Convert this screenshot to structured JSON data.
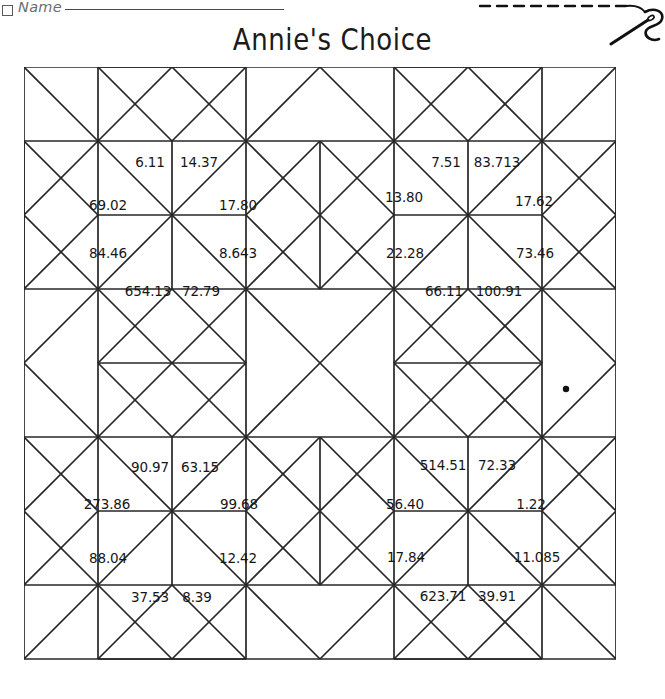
{
  "header": {
    "name_label": "Name",
    "name_checkbox_icon": "checkbox-icon",
    "title": "Annie's Choice",
    "decoration_icon": "needle-and-thread-icon"
  },
  "quilt": {
    "pattern_name": "Annie's Choice",
    "grid_columns": 8,
    "grid_rows": 8,
    "cell_size_px": 74,
    "line_color": "#262626",
    "fill_color": "#ffffff",
    "dot_marker": {
      "name": "ink-dot-mark",
      "x_px": 566,
      "y_px": 389
    },
    "blocks": [
      {
        "id": "block-top-left",
        "row": 0,
        "col": 0,
        "numbers": [
          {
            "slot": "top-left",
            "value": "6.11",
            "x": 150,
            "y": 163
          },
          {
            "slot": "top-right",
            "value": "14.37",
            "x": 199,
            "y": 163
          },
          {
            "slot": "left-upper",
            "value": "69.02",
            "x": 108,
            "y": 206
          },
          {
            "slot": "right-upper",
            "value": "17.80",
            "x": 238,
            "y": 206
          },
          {
            "slot": "left-lower",
            "value": "84.46",
            "x": 108,
            "y": 254
          },
          {
            "slot": "right-lower",
            "value": "8.643",
            "x": 238,
            "y": 254
          },
          {
            "slot": "bottom-left",
            "value": "654.13",
            "x": 148,
            "y": 292
          },
          {
            "slot": "bottom-right",
            "value": "72.79",
            "x": 201,
            "y": 292
          }
        ]
      },
      {
        "id": "block-top-right",
        "row": 0,
        "col": 1,
        "numbers": [
          {
            "slot": "top-left",
            "value": "7.51",
            "x": 446,
            "y": 163
          },
          {
            "slot": "top-right",
            "value": "83.713",
            "x": 497,
            "y": 163
          },
          {
            "slot": "left-upper",
            "value": "13.80",
            "x": 404,
            "y": 198
          },
          {
            "slot": "right-upper",
            "value": "17.62",
            "x": 534,
            "y": 202
          },
          {
            "slot": "left-lower",
            "value": "22.28",
            "x": 405,
            "y": 254
          },
          {
            "slot": "right-lower",
            "value": "73.46",
            "x": 535,
            "y": 254
          },
          {
            "slot": "bottom-left",
            "value": "66.11",
            "x": 444,
            "y": 292
          },
          {
            "slot": "bottom-right",
            "value": "100.91",
            "x": 499,
            "y": 292
          }
        ]
      },
      {
        "id": "block-bottom-left",
        "row": 1,
        "col": 0,
        "numbers": [
          {
            "slot": "top-left",
            "value": "90.97",
            "x": 150,
            "y": 468
          },
          {
            "slot": "top-right",
            "value": "63.15",
            "x": 200,
            "y": 468
          },
          {
            "slot": "left-upper",
            "value": "273.86",
            "x": 107,
            "y": 505
          },
          {
            "slot": "right-upper",
            "value": "99.68",
            "x": 239,
            "y": 505
          },
          {
            "slot": "left-lower",
            "value": "88.04",
            "x": 108,
            "y": 559
          },
          {
            "slot": "right-lower",
            "value": "12.42",
            "x": 238,
            "y": 559
          },
          {
            "slot": "bottom-left",
            "value": "37.53",
            "x": 150,
            "y": 598
          },
          {
            "slot": "bottom-right",
            "value": "8.39",
            "x": 197,
            "y": 598
          }
        ]
      },
      {
        "id": "block-bottom-right",
        "row": 1,
        "col": 1,
        "numbers": [
          {
            "slot": "top-left",
            "value": "514.51",
            "x": 443,
            "y": 466
          },
          {
            "slot": "top-right",
            "value": "72.33",
            "x": 497,
            "y": 466
          },
          {
            "slot": "left-upper",
            "value": "56.40",
            "x": 405,
            "y": 505
          },
          {
            "slot": "right-upper",
            "value": "1.22",
            "x": 531,
            "y": 505
          },
          {
            "slot": "left-lower",
            "value": "17.84",
            "x": 406,
            "y": 558
          },
          {
            "slot": "right-lower",
            "value": "11.085",
            "x": 537,
            "y": 558
          },
          {
            "slot": "bottom-left",
            "value": "623.71",
            "x": 443,
            "y": 597
          },
          {
            "slot": "bottom-right",
            "value": "39.91",
            "x": 497,
            "y": 597
          }
        ]
      }
    ]
  }
}
